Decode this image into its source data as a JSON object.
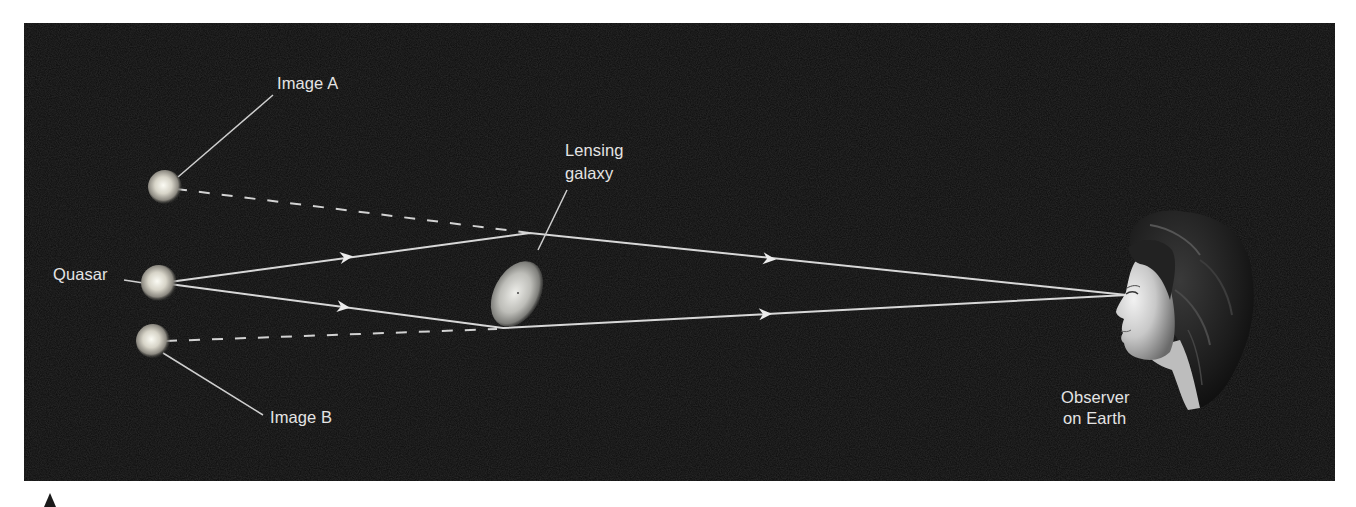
{
  "figure": {
    "background_color": "#0b0b0b",
    "line_color": "#d8d8d8",
    "label_color": "#e4e4e4"
  },
  "labels": {
    "image_a": "Image A",
    "image_b": "Image B",
    "quasar": "Quasar",
    "lensing_galaxy_line1": "Lensing",
    "lensing_galaxy_line2": "galaxy",
    "observer_line1": "Observer",
    "observer_line2": "on Earth"
  },
  "objects": [
    {
      "id": "image-a",
      "type": "apparent-quasar-image",
      "label": "Image A"
    },
    {
      "id": "quasar",
      "type": "light-source",
      "label": "Quasar"
    },
    {
      "id": "image-b",
      "type": "apparent-quasar-image",
      "label": "Image B"
    },
    {
      "id": "lensing-galaxy",
      "type": "gravitational-lens",
      "label": "Lensing galaxy"
    },
    {
      "id": "observer",
      "type": "observer",
      "label": "Observer on Earth"
    }
  ],
  "light_paths": [
    {
      "from": "quasar",
      "via": "lensing-galaxy (above)",
      "to": "observer",
      "arrows": 2,
      "style": "solid"
    },
    {
      "from": "quasar",
      "via": "lensing-galaxy (below)",
      "to": "observer",
      "arrows": 2,
      "style": "solid"
    },
    {
      "from": "image-a",
      "to": "lensing-galaxy (above)",
      "style": "dashed",
      "meaning": "apparent direction"
    },
    {
      "from": "image-b",
      "to": "lensing-galaxy (below)",
      "style": "dashed",
      "meaning": "apparent direction"
    }
  ]
}
